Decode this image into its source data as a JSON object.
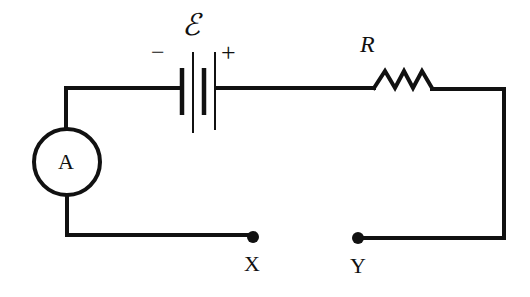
{
  "diagram": {
    "type": "circuit",
    "stroke_color": "#111111",
    "background": "#ffffff",
    "battery": {
      "emf_symbol": "ℰ",
      "negative_sign": "−",
      "positive_sign": "+"
    },
    "resistor": {
      "label": "R"
    },
    "ammeter": {
      "label": "A"
    },
    "terminals": [
      {
        "label": "X"
      },
      {
        "label": "Y"
      }
    ]
  }
}
